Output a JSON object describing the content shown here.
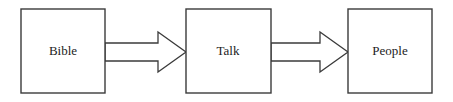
{
  "diagram": {
    "background_color": "#ffffff",
    "stroke_color": "#3b3b3b",
    "text_color": "#1c1c1c",
    "nodes": [
      {
        "id": "bible",
        "label": "Bible",
        "x": 21,
        "y": 9,
        "width": 84,
        "height": 84,
        "cx": 63,
        "cy": 51
      },
      {
        "id": "talk",
        "label": "Talk",
        "x": 186,
        "y": 9,
        "width": 85,
        "height": 84,
        "cx": 228,
        "cy": 51
      },
      {
        "id": "people",
        "label": "People",
        "x": 348,
        "y": 9,
        "width": 84,
        "height": 84,
        "cx": 390,
        "cy": 51
      }
    ],
    "arrows": [
      {
        "id": "bible-to-talk",
        "from": "bible",
        "to": "talk",
        "label": "",
        "shape": "block-arrow",
        "points": "105,43 158,43 158,32 186,52 158,72 158,61 105,61"
      },
      {
        "id": "talk-to-people",
        "from": "talk",
        "to": "people",
        "label": "",
        "shape": "block-arrow",
        "points": "271,43 320,43 320,32 348,52 320,72 320,61 271,61"
      }
    ]
  }
}
